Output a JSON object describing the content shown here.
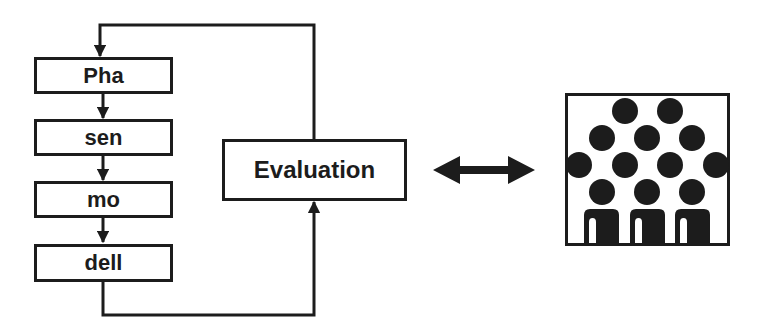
{
  "diagram": {
    "pipeline": {
      "stages": [
        {
          "label": "Pha"
        },
        {
          "label": "sen"
        },
        {
          "label": "mo"
        },
        {
          "label": "dell"
        }
      ]
    },
    "evaluation": {
      "label": "Evaluation"
    },
    "connectors": {
      "feedback_loop": "evaluation-to-first-stage",
      "output_to_evaluation": "last-stage-to-evaluation",
      "bidirectional": "evaluation-to-audience"
    },
    "audience_icon": {
      "name": "audience-group-icon",
      "head_rows": [
        2,
        3,
        4,
        3
      ],
      "body_count": 3
    },
    "colors": {
      "ink": "#1c1c1c",
      "background": "#ffffff"
    }
  }
}
